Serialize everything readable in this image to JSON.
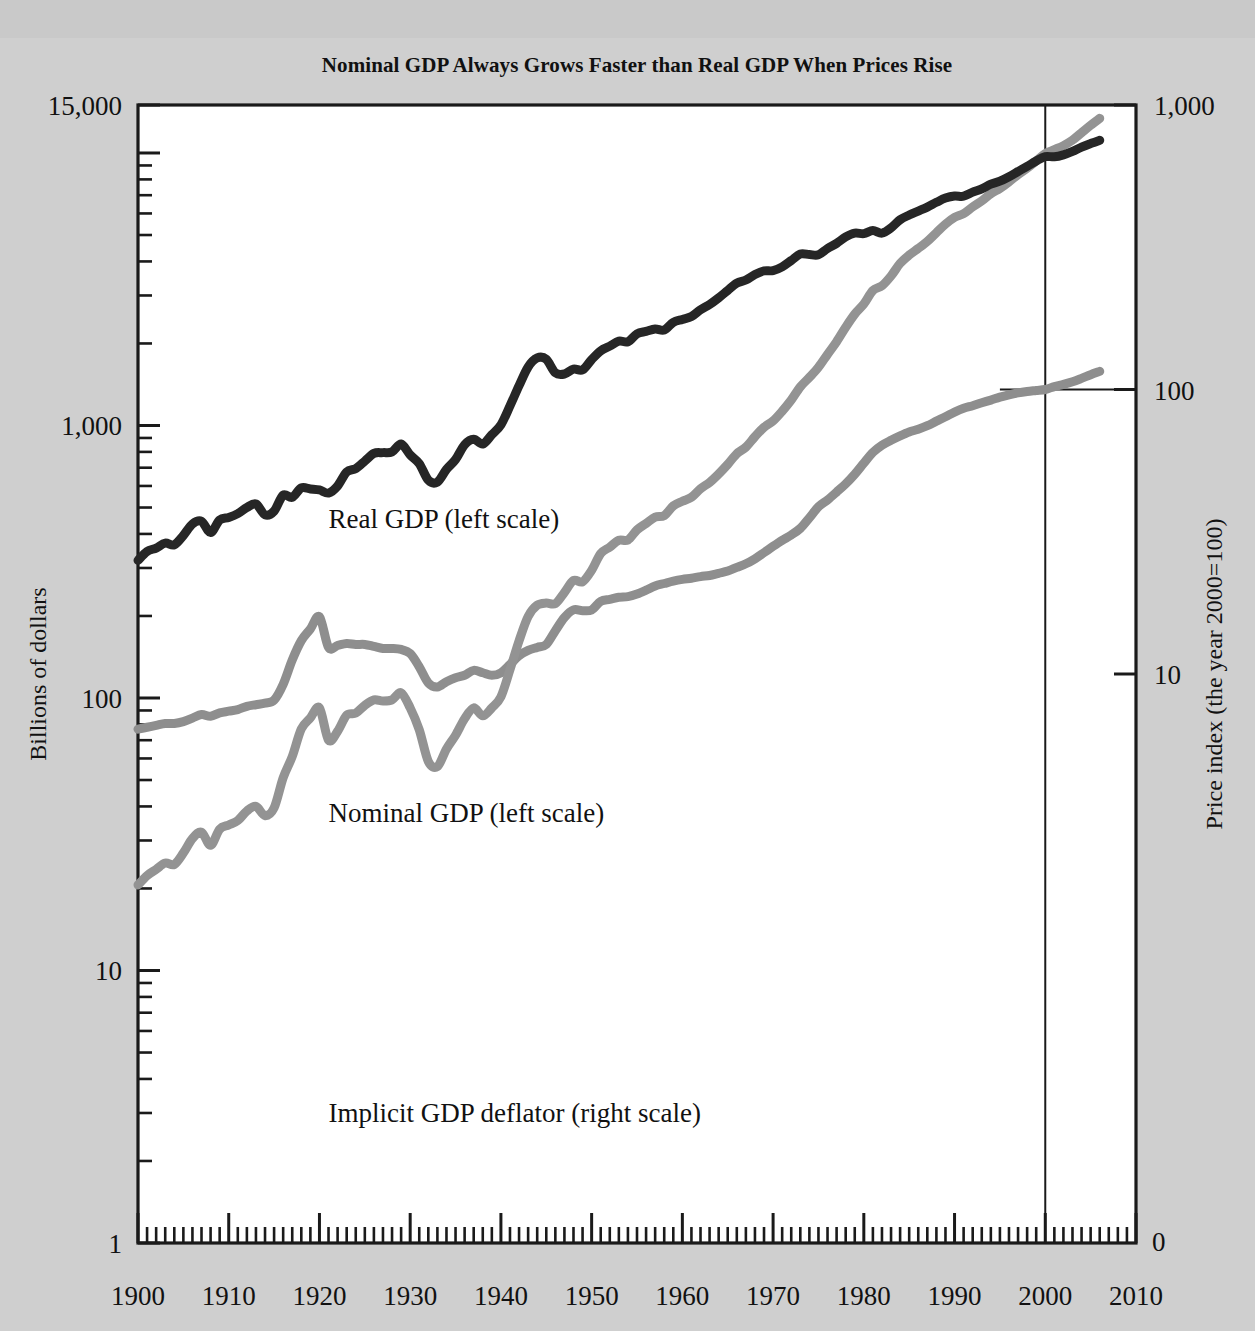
{
  "chart_data": {
    "type": "line",
    "title": "Nominal GDP Always Grows Faster than Real GDP When Prices Rise",
    "xlabel": "",
    "ylabel": "Billions of dollars",
    "y2label": "Price index (the year 2000=100)",
    "xlim": [
      1900,
      2010
    ],
    "xticks": [
      1900,
      1910,
      1920,
      1930,
      1940,
      1950,
      1960,
      1970,
      1980,
      1990,
      2000,
      2010
    ],
    "xticklabels": [
      "1900",
      "1910",
      "1920",
      "1930",
      "1940",
      "1950",
      "1960",
      "1970",
      "1980",
      "1990",
      "2000",
      "2010"
    ],
    "xminor_step": 1,
    "yscale": "log",
    "ylim": [
      1,
      15000
    ],
    "yticks": [
      1,
      10,
      100,
      1000,
      15000
    ],
    "yticklabels": [
      "1",
      "10",
      "100",
      "1,000",
      "15,000"
    ],
    "y2scale": "log",
    "y2lim": [
      0.1,
      1000
    ],
    "y2ticks": [
      10,
      100,
      1000
    ],
    "y2ticklabels": [
      "10",
      "100",
      "1,000"
    ],
    "y2_zero_label": "0",
    "grid": false,
    "legend_position": "inline-annotations",
    "annotations": [
      {
        "name": "real-gdp-label",
        "text": "Real GDP (left scale)",
        "x": 1921,
        "y_px": 528
      },
      {
        "name": "nominal-gdp-label",
        "text": "Nominal GDP (left scale)",
        "x": 1921,
        "y_px": 822
      },
      {
        "name": "deflator-label",
        "text": "Implicit GDP deflator (right scale)",
        "x": 1921,
        "y_px": 1122
      }
    ],
    "reference_lines": [
      {
        "name": "year-2000-vertical",
        "orient": "vertical",
        "x": 2000,
        "from_y_px": 105,
        "to_y_px": 1243
      },
      {
        "name": "deflator-100-horizontal",
        "orient": "horizontal",
        "y2": 100,
        "from_x": 1995,
        "to_x": 2010
      }
    ],
    "series": [
      {
        "name": "Real GDP (left scale)",
        "label": "Real GDP (left scale)",
        "axis": "left",
        "color": "#262626",
        "width": 9,
        "x": [
          1900,
          1901,
          1902,
          1903,
          1904,
          1905,
          1906,
          1907,
          1908,
          1909,
          1910,
          1911,
          1912,
          1913,
          1914,
          1915,
          1916,
          1917,
          1918,
          1919,
          1920,
          1921,
          1922,
          1923,
          1924,
          1925,
          1926,
          1927,
          1928,
          1929,
          1930,
          1931,
          1932,
          1933,
          1934,
          1935,
          1936,
          1937,
          1938,
          1939,
          1940,
          1941,
          1942,
          1943,
          1944,
          1945,
          1946,
          1947,
          1948,
          1949,
          1950,
          1951,
          1952,
          1953,
          1954,
          1955,
          1956,
          1957,
          1958,
          1959,
          1960,
          1961,
          1962,
          1963,
          1964,
          1965,
          1966,
          1967,
          1968,
          1969,
          1970,
          1971,
          1972,
          1973,
          1974,
          1975,
          1976,
          1977,
          1978,
          1979,
          1980,
          1981,
          1982,
          1983,
          1984,
          1985,
          1986,
          1987,
          1988,
          1989,
          1990,
          1991,
          1992,
          1993,
          1994,
          1995,
          1996,
          1997,
          1998,
          1999,
          2000,
          2001,
          2002,
          2003,
          2004,
          2005,
          2006
        ],
        "values": [
          320,
          345,
          355,
          370,
          365,
          395,
          435,
          445,
          405,
          450,
          460,
          475,
          500,
          515,
          470,
          485,
          555,
          545,
          590,
          585,
          580,
          565,
          600,
          675,
          695,
          740,
          790,
          795,
          800,
          855,
          780,
          725,
          630,
          620,
          690,
          750,
          850,
          890,
          855,
          925,
          1005,
          1180,
          1400,
          1640,
          1770,
          1750,
          1560,
          1545,
          1610,
          1600,
          1745,
          1880,
          1955,
          2040,
          2030,
          2170,
          2215,
          2260,
          2240,
          2390,
          2450,
          2510,
          2660,
          2780,
          2940,
          3130,
          3330,
          3420,
          3580,
          3690,
          3700,
          3820,
          4030,
          4260,
          4240,
          4230,
          4460,
          4660,
          4920,
          5080,
          5060,
          5190,
          5080,
          5310,
          5690,
          5920,
          6120,
          6330,
          6590,
          6830,
          6950,
          6940,
          7180,
          7380,
          7690,
          7880,
          8180,
          8550,
          8930,
          9350,
          9700,
          9680,
          9840,
          10130,
          10510,
          10830,
          11130
        ]
      },
      {
        "name": "Nominal GDP (left scale)",
        "label": "Nominal GDP (left scale)",
        "axis": "left",
        "color": "#939393",
        "width": 9,
        "x": [
          1900,
          1901,
          1902,
          1903,
          1904,
          1905,
          1906,
          1907,
          1908,
          1909,
          1910,
          1911,
          1912,
          1913,
          1914,
          1915,
          1916,
          1917,
          1918,
          1919,
          1920,
          1921,
          1922,
          1923,
          1924,
          1925,
          1926,
          1927,
          1928,
          1929,
          1930,
          1931,
          1932,
          1933,
          1934,
          1935,
          1936,
          1937,
          1938,
          1939,
          1940,
          1941,
          1942,
          1943,
          1944,
          1945,
          1946,
          1947,
          1948,
          1949,
          1950,
          1951,
          1952,
          1953,
          1954,
          1955,
          1956,
          1957,
          1958,
          1959,
          1960,
          1961,
          1962,
          1963,
          1964,
          1965,
          1966,
          1967,
          1968,
          1969,
          1970,
          1971,
          1972,
          1973,
          1974,
          1975,
          1976,
          1977,
          1978,
          1979,
          1980,
          1981,
          1982,
          1983,
          1984,
          1985,
          1986,
          1987,
          1988,
          1989,
          1990,
          1991,
          1992,
          1993,
          1994,
          1995,
          1996,
          1997,
          1998,
          1999,
          2000,
          2001,
          2002,
          2003,
          2004,
          2005,
          2006
        ],
        "values": [
          20.6,
          22.3,
          23.5,
          24.8,
          24.5,
          27.0,
          30.5,
          32.2,
          28.8,
          33.0,
          34.2,
          35.5,
          38.5,
          40.0,
          37.0,
          39.5,
          51.0,
          61.0,
          77.0,
          84.5,
          92.0,
          70.0,
          75.5,
          86.5,
          88.0,
          94.0,
          98.5,
          97.5,
          98.5,
          104.5,
          92.0,
          76.5,
          58.5,
          56.0,
          65.0,
          73.0,
          84.0,
          92.0,
          86.0,
          92.0,
          101.0,
          127.0,
          162.0,
          199.0,
          219.0,
          223.0,
          222.0,
          244.0,
          270.0,
          267.0,
          294.0,
          339.0,
          358.0,
          379.0,
          380.0,
          414.0,
          437.0,
          461.0,
          467.0,
          507.0,
          527.0,
          545.0,
          586.0,
          618.0,
          664.0,
          720.0,
          788.0,
          833.0,
          910.0,
          985.0,
          1039,
          1128,
          1240,
          1386,
          1501,
          1635,
          1824,
          2030,
          2294,
          2563,
          2790,
          3128,
          3255,
          3536,
          3933,
          4220,
          4463,
          4740,
          5100,
          5482,
          5800,
          5992,
          6342,
          6667,
          7085,
          7415,
          7839,
          8332,
          8794,
          9354,
          9952,
          10286,
          10642,
          11142,
          11868,
          12638,
          13399
        ]
      },
      {
        "name": "Implicit GDP deflator (right scale)",
        "label": "Implicit GDP deflator (right scale)",
        "axis": "right",
        "color": "#8e8e8e",
        "width": 9,
        "x": [
          1900,
          1901,
          1902,
          1903,
          1904,
          1905,
          1906,
          1907,
          1908,
          1909,
          1910,
          1911,
          1912,
          1913,
          1914,
          1915,
          1916,
          1917,
          1918,
          1919,
          1920,
          1921,
          1922,
          1923,
          1924,
          1925,
          1926,
          1927,
          1928,
          1929,
          1930,
          1931,
          1932,
          1933,
          1934,
          1935,
          1936,
          1937,
          1938,
          1939,
          1940,
          1941,
          1942,
          1943,
          1944,
          1945,
          1946,
          1947,
          1948,
          1949,
          1950,
          1951,
          1952,
          1953,
          1954,
          1955,
          1956,
          1957,
          1958,
          1959,
          1960,
          1961,
          1962,
          1963,
          1964,
          1965,
          1966,
          1967,
          1968,
          1969,
          1970,
          1971,
          1972,
          1973,
          1974,
          1975,
          1976,
          1977,
          1978,
          1979,
          1980,
          1981,
          1982,
          1983,
          1984,
          1985,
          1986,
          1987,
          1988,
          1989,
          1990,
          1991,
          1992,
          1993,
          1994,
          1995,
          1996,
          1997,
          1998,
          1999,
          2000,
          2001,
          2002,
          2003,
          2004,
          2005,
          2006
        ],
        "values": [
          6.4,
          6.5,
          6.6,
          6.7,
          6.7,
          6.8,
          7.0,
          7.2,
          7.1,
          7.3,
          7.4,
          7.5,
          7.7,
          7.8,
          7.9,
          8.1,
          9.2,
          11.2,
          13.1,
          14.4,
          15.9,
          12.4,
          12.6,
          12.8,
          12.7,
          12.7,
          12.5,
          12.3,
          12.3,
          12.2,
          11.8,
          10.6,
          9.3,
          9.0,
          9.4,
          9.7,
          9.9,
          10.3,
          10.1,
          9.9,
          10.1,
          10.8,
          11.6,
          12.1,
          12.4,
          12.7,
          14.2,
          15.8,
          16.8,
          16.7,
          16.8,
          18.0,
          18.3,
          18.6,
          18.7,
          19.1,
          19.7,
          20.4,
          20.8,
          21.2,
          21.5,
          21.7,
          22.0,
          22.2,
          22.6,
          23.0,
          23.7,
          24.4,
          25.4,
          26.7,
          28.1,
          29.5,
          30.8,
          32.5,
          35.4,
          38.7,
          40.9,
          43.6,
          46.6,
          50.4,
          55.1,
          60.1,
          63.7,
          66.3,
          68.7,
          70.9,
          72.5,
          74.6,
          77.4,
          80.2,
          83.3,
          85.9,
          87.7,
          89.8,
          91.8,
          94.0,
          95.8,
          97.3,
          98.4,
          99.2,
          100.0,
          102.4,
          104.2,
          106.4,
          109.4,
          112.7,
          115.8
        ]
      }
    ]
  }
}
